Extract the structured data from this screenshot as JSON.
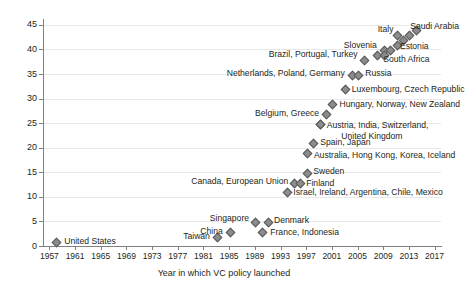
{
  "chart_data": {
    "type": "scatter",
    "title": "",
    "xlabel": "Year in which VC policy launched",
    "ylabel": "",
    "xlim": [
      1956,
      2018
    ],
    "ylim": [
      0,
      46
    ],
    "grid": true,
    "legend": "none",
    "y_ticks": [
      0,
      5,
      10,
      15,
      20,
      25,
      30,
      35,
      40,
      45
    ],
    "x_ticks": [
      1957,
      1961,
      1965,
      1969,
      1973,
      1977,
      1981,
      1985,
      1989,
      1993,
      1997,
      2001,
      2005,
      2009,
      2013,
      2017
    ],
    "points": [
      {
        "label": "United States",
        "x": 1958,
        "y": 1,
        "label_pos": "right"
      },
      {
        "label": "Taiwan",
        "x": 1983,
        "y": 2,
        "label_pos": "left"
      },
      {
        "label": "China",
        "x": 1985,
        "y": 3,
        "label_pos": "left"
      },
      {
        "label": "Singapore",
        "x": 1989,
        "y": 5,
        "label_pos": "left"
      },
      {
        "label": "France, Indonesia",
        "x": 1990,
        "y": 3,
        "label_pos": "right"
      },
      {
        "label": "Denmark",
        "x": 1991,
        "y": 5,
        "label_pos": "right"
      },
      {
        "label": "Israel, Ireland, Argentina, Chile, Mexico",
        "x": 1994,
        "y": 11,
        "label_pos": "right"
      },
      {
        "label": "Canada, European Union",
        "x": 1995,
        "y": 13,
        "label_pos": "left"
      },
      {
        "label": "Finland",
        "x": 1996,
        "y": 13,
        "label_pos": "right"
      },
      {
        "label": "Sweden",
        "x": 1997,
        "y": 15,
        "label_pos": "right"
      },
      {
        "label": "Australia, Hong Kong, Korea, Iceland",
        "x": 1997,
        "y": 19,
        "label_pos": "right"
      },
      {
        "label": "Spain, Japan",
        "x": 1998,
        "y": 21,
        "label_pos": "right"
      },
      {
        "label": "Austria, India, Switzerland,",
        "x": 1999,
        "y": 25,
        "label_pos": "right"
      },
      {
        "label": "United Kingdom",
        "x": 1999,
        "y": 25,
        "label_pos": "none"
      },
      {
        "label": "Belgium, Greece",
        "x": 2000,
        "y": 27,
        "label_pos": "left"
      },
      {
        "label": "Hungary, Norway, New Zealand",
        "x": 2001,
        "y": 29,
        "label_pos": "right"
      },
      {
        "label": "Luxembourg, Czech Republic",
        "x": 2003,
        "y": 32,
        "label_pos": "right"
      },
      {
        "label": "Netherlands, Poland, Germany",
        "x": 2004,
        "y": 35,
        "label_pos": "left"
      },
      {
        "label": "Russia",
        "x": 2005,
        "y": 35,
        "label_pos": "right"
      },
      {
        "label": "Brazil, Portugal, Turkey",
        "x": 2006,
        "y": 38,
        "label_pos": "left"
      },
      {
        "label": "",
        "x": 2008,
        "y": 39,
        "label_pos": "none"
      },
      {
        "label": "Slovenia",
        "x": 2009,
        "y": 40,
        "label_pos": "left"
      },
      {
        "label": "South Africa",
        "x": 2009,
        "y": 39,
        "label_pos": "none"
      },
      {
        "label": "",
        "x": 2010,
        "y": 40,
        "label_pos": "none"
      },
      {
        "label": "Estonia",
        "x": 2011,
        "y": 41,
        "label_pos": "right"
      },
      {
        "label": "Italy",
        "x": 2011,
        "y": 43,
        "label_pos": "none"
      },
      {
        "label": "",
        "x": 2012,
        "y": 42,
        "label_pos": "none"
      },
      {
        "label": "",
        "x": 2013,
        "y": 43,
        "label_pos": "none"
      },
      {
        "label": "Saudi Arabia",
        "x": 2014,
        "y": 44,
        "label_pos": "none"
      }
    ],
    "annotations": [
      {
        "text": "United States",
        "x": 1959.3,
        "y": 1.0,
        "align": "start"
      },
      {
        "text": "Taiwan",
        "x": 1982.0,
        "y": 2.0,
        "align": "end"
      },
      {
        "text": "China",
        "x": 1984.0,
        "y": 3.1,
        "align": "end"
      },
      {
        "text": "Singapore",
        "x": 1988.1,
        "y": 5.6,
        "align": "end"
      },
      {
        "text": "France, Indonesia",
        "x": 1991.4,
        "y": 2.8,
        "align": "start"
      },
      {
        "text": "Denmark",
        "x": 1992.0,
        "y": 5.2,
        "align": "start"
      },
      {
        "text": "Israel, Ireland, Argentina, Chile, Mexico",
        "x": 1995.0,
        "y": 11.0,
        "align": "start"
      },
      {
        "text": "Canada, European Union",
        "x": 1994.2,
        "y": 13.2,
        "align": "end"
      },
      {
        "text": "Finland",
        "x": 1997.0,
        "y": 12.9,
        "align": "start"
      },
      {
        "text": "Sweden",
        "x": 1998.1,
        "y": 15.2,
        "align": "start"
      },
      {
        "text": "Australia, Hong Kong, Korea, Iceland",
        "x": 1998.2,
        "y": 18.6,
        "align": "start"
      },
      {
        "text": "Spain, Japan",
        "x": 1999.2,
        "y": 21.1,
        "align": "start"
      },
      {
        "text": "Austria, India, Switzerland,",
        "x": 2000.2,
        "y": 24.7,
        "align": "start"
      },
      {
        "text": "United Kingdom",
        "x": 2012.0,
        "y": 22.4,
        "align": "end"
      },
      {
        "text": "Belgium, Greece",
        "x": 1999.0,
        "y": 27.0,
        "align": "end"
      },
      {
        "text": "Hungary, Norway, New Zealand",
        "x": 2002.2,
        "y": 29.0,
        "align": "start"
      },
      {
        "text": "Luxembourg, Czech Republic",
        "x": 2004.1,
        "y": 31.9,
        "align": "start"
      },
      {
        "text": "Netherlands, Poland, Germany",
        "x": 2003.0,
        "y": 35.2,
        "align": "end"
      },
      {
        "text": "Russia",
        "x": 2006.2,
        "y": 35.2,
        "align": "start"
      },
      {
        "text": "Brazil, Portugal, Turkey",
        "x": 2005.0,
        "y": 39.0,
        "align": "end"
      },
      {
        "text": "Slovenia",
        "x": 2008.0,
        "y": 41.0,
        "align": "end"
      },
      {
        "text": "South Africa",
        "x": 2009.0,
        "y": 38.0,
        "align": "start"
      },
      {
        "text": "Estonia",
        "x": 2011.6,
        "y": 40.8,
        "align": "start"
      },
      {
        "text": "Italy",
        "x": 2010.6,
        "y": 44.1,
        "align": "end"
      },
      {
        "text": "Saudi Arabia",
        "x": 2013.2,
        "y": 44.8,
        "align": "start"
      }
    ]
  },
  "colors": {
    "marker_fill": "#8c8c8c",
    "marker_edge": "#595959",
    "gridline": "#e8e8e8",
    "axis": "#808080",
    "text": "#231f20",
    "background": "#ffffff"
  }
}
